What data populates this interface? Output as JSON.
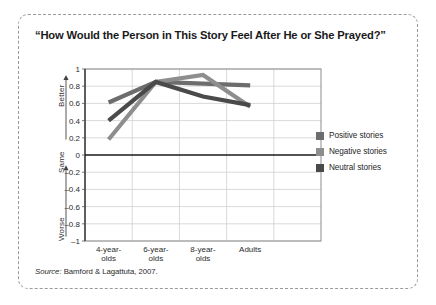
{
  "figure": {
    "title": "“How Would the Person in This Story Feel After He or She Prayed?”",
    "source_keyword": "Source:",
    "source_text": " Bamford & Lagattuta, 2007.",
    "frame_border_color": "#9a9a9a",
    "background_color": "#ffffff"
  },
  "axis_captions": {
    "better": "Better",
    "same": "Same",
    "worse": "Worse"
  },
  "legend": {
    "items": [
      {
        "label": "Positive stories",
        "color": "#6d6d6d"
      },
      {
        "label": "Negative stories",
        "color": "#8e8e8e"
      },
      {
        "label": "Neutral stories",
        "color": "#4a4a4a"
      }
    ]
  },
  "chart_data": {
    "type": "line",
    "title": "“How Would the Person in This Story Feel After He or She Prayed?”",
    "xlabel": "",
    "ylabel": "",
    "categories": [
      "4-year-olds",
      "6-year-olds",
      "8-year-olds",
      "Adults"
    ],
    "x_tick_labels": [
      [
        "4-year-",
        "olds"
      ],
      [
        "6-year-",
        "olds"
      ],
      [
        "8-year-",
        "olds"
      ],
      [
        "Adults",
        ""
      ]
    ],
    "ylim": [
      -1,
      1
    ],
    "y_ticks": [
      1,
      0.8,
      0.6,
      0.4,
      0.2,
      0,
      -0.2,
      -0.4,
      -0.6,
      -0.8,
      -1
    ],
    "y_tick_labels": [
      "1",
      "0.8",
      "0.6",
      "0.4",
      "0.2",
      "0",
      "–0.2",
      "–0.4",
      "–0.6",
      "–0.8",
      "–1"
    ],
    "y_axis_annotations": [
      "Better",
      "Same",
      "Worse"
    ],
    "grid": true,
    "zero_line": true,
    "legend_position": "right",
    "series": [
      {
        "name": "Positive stories",
        "color": "#6d6d6d",
        "values": [
          0.61,
          0.85,
          0.83,
          0.81
        ]
      },
      {
        "name": "Negative stories",
        "color": "#8e8e8e",
        "values": [
          0.18,
          0.85,
          0.93,
          0.56
        ]
      },
      {
        "name": "Neutral stories",
        "color": "#4a4a4a",
        "values": [
          0.4,
          0.85,
          0.68,
          0.58
        ]
      }
    ]
  }
}
